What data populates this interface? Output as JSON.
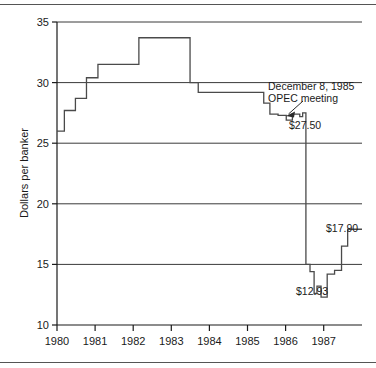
{
  "chart_data": {
    "type": "line",
    "title": "",
    "subtitle": "",
    "xlabel": "",
    "ylabel": "Dollars per banker",
    "xlim": [
      1980.0,
      1987.45
    ],
    "ylim": [
      10,
      35
    ],
    "ytick_labels": [
      "10",
      "15",
      "20",
      "25",
      "30",
      "35"
    ],
    "ytick_values": [
      10,
      15,
      20,
      25,
      30,
      35
    ],
    "xtick_labels": [
      "1980",
      "1981",
      "1982",
      "1983",
      "1984",
      "1985",
      "1986",
      "1987"
    ],
    "xtick_values": [
      1980,
      1981,
      1982,
      1983,
      1984,
      1985,
      1986,
      1987
    ],
    "grid": "horizontal",
    "legend": "none",
    "step_style": "post",
    "series": [
      {
        "name": "OPEC official crude oil price",
        "x": [
          1980.0,
          1980.18,
          1980.45,
          1980.72,
          1981.0,
          1981.3,
          1982.0,
          1983.25,
          1983.45,
          1984.55,
          1985.05,
          1985.2,
          1985.4,
          1985.6,
          1985.75,
          1985.93,
          1986.0,
          1986.08,
          1986.18,
          1986.28,
          1986.35,
          1986.45,
          1986.6,
          1986.78,
          1986.95,
          1987.1,
          1987.3
        ],
        "y": [
          26.0,
          27.7,
          28.7,
          30.4,
          31.5,
          31.5,
          33.7,
          30.0,
          29.2,
          29.2,
          28.3,
          27.4,
          27.3,
          26.9,
          27.4,
          27.2,
          27.5,
          15.0,
          14.4,
          12.6,
          13.2,
          12.3,
          14.2,
          14.5,
          16.5,
          17.9,
          17.9
        ]
      }
    ],
    "annotations": [
      {
        "id": "opec-meeting",
        "text_line1": "December 8, 1985",
        "text_line2": "OPEC meeting",
        "pointer_x": 1986.0,
        "pointer_y": 27.5
      },
      {
        "id": "price-before-crash",
        "text": "$27.50",
        "x": 1986.02,
        "y": 26.2
      },
      {
        "id": "price-low",
        "text": "$12.93",
        "x": 1986.5,
        "y": 12.6
      },
      {
        "id": "price-recovered",
        "text": "$17.90",
        "x": 1987.15,
        "y": 17.9
      }
    ]
  },
  "colors": {
    "series_stroke": "#4a4a4a",
    "axis": "#1a1a1a",
    "grid": "#3a3a3a",
    "background": "#ffffff",
    "rule": "#555555"
  },
  "axis": {
    "y_title": "Dollars per banker"
  },
  "ticks": {
    "y": [
      {
        "label": "35"
      },
      {
        "label": "30"
      },
      {
        "label": "25"
      },
      {
        "label": "20"
      },
      {
        "label": "15"
      },
      {
        "label": "10"
      }
    ],
    "x": [
      {
        "label": "1980"
      },
      {
        "label": "1981"
      },
      {
        "label": "1982"
      },
      {
        "label": "1983"
      },
      {
        "label": "1984"
      },
      {
        "label": "1985"
      },
      {
        "label": "1986"
      },
      {
        "label": "1987"
      }
    ]
  },
  "labels": {
    "anno_line1": "December 8, 1985",
    "anno_line2": "OPEC meeting",
    "price_27": "$27.50",
    "price_12": "$12.93",
    "price_17": "$17.90"
  }
}
